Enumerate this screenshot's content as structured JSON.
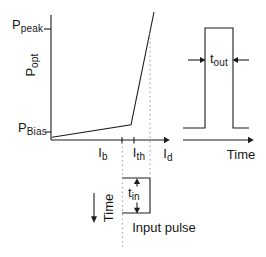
{
  "colors": {
    "background": "#ffffff",
    "line": "#1c1c1c",
    "dotted": "#ababab",
    "text": "#161616"
  },
  "li_curve_panel": {
    "y_axis": {
      "peak_label": {
        "base": "P",
        "sub": "peak"
      },
      "axis_label": {
        "base": "P",
        "sub": "opt"
      },
      "bias_label": {
        "base": "P",
        "sub": "Bias"
      }
    },
    "x_axis": {
      "tick_labels": [
        {
          "base": "I",
          "sub": "b"
        },
        {
          "base": "I",
          "sub": "th"
        },
        {
          "base": "I",
          "sub": "d"
        }
      ]
    }
  },
  "output_pulse_panel": {
    "width_label": {
      "base": "t",
      "sub": "out"
    },
    "time_axis_label": "Time"
  },
  "input_pulse_panel": {
    "width_label": {
      "base": "t",
      "sub": "in"
    },
    "time_axis_label": "Time",
    "caption": "Input pulse"
  }
}
